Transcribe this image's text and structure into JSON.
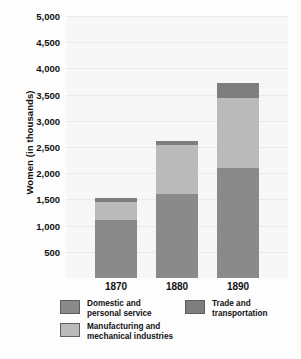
{
  "chart_data": {
    "type": "bar",
    "subtype": "stacked",
    "title": "",
    "xlabel": "",
    "ylabel": "Women (in thousands)",
    "categories": [
      "1870",
      "1880",
      "1890"
    ],
    "series": [
      {
        "name": "Domestic and\npersonal service",
        "values": [
          1100,
          1600,
          2100
        ],
        "color": "#8a8a8a"
      },
      {
        "name": "Manufacturing and\nmechanical industries",
        "values": [
          360,
          940,
          1330
        ],
        "color": "#bbbbbb"
      },
      {
        "name": "Trade and\ntransportation",
        "values": [
          60,
          80,
          290
        ],
        "color": "#7e7e7e"
      }
    ],
    "totals": [
      1520,
      2620,
      3720
    ],
    "ylim": [
      0,
      5000
    ],
    "ytick_values": [
      500,
      1000,
      1500,
      2000,
      2500,
      3000,
      3500,
      4000,
      4500,
      5000
    ],
    "ytick_labels": [
      "500",
      "1,000",
      "1,500",
      "2,000",
      "2,500",
      "3,000",
      "3,500",
      "4,000",
      "4,500",
      "5,000"
    ],
    "grid": true,
    "legend_position": "bottom"
  },
  "axes": {
    "y_title": "Women (in thousands)"
  },
  "legend": {
    "items": [
      {
        "label": "Domestic and\npersonal service",
        "swatch": "domestic-swatch"
      },
      {
        "label": "Manufacturing and\nmechanical industries",
        "swatch": "manufacturing-swatch"
      },
      {
        "label": "Trade and\ntransportation",
        "swatch": "trade-swatch"
      }
    ]
  }
}
